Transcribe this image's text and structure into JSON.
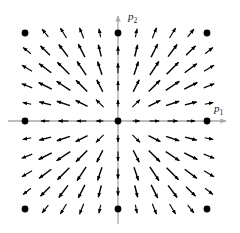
{
  "figure": {
    "title": "",
    "background_color": "#ffffff"
  },
  "axes": {
    "x_axis": {
      "label": "p",
      "label_subscript": "1",
      "color": "#a8a8a8",
      "y_pixel": 121,
      "x_start": 8,
      "x_end": 228,
      "arrowhead": "right"
    },
    "y_axis": {
      "label": "p",
      "label_subscript": "2",
      "color": "#a8a8a8",
      "x_pixel": 118,
      "y_start": 224,
      "y_end": 14,
      "arrowhead": "up"
    }
  },
  "markers": {
    "color": "#000000",
    "radius": 3.4,
    "points": [
      {
        "x": 118,
        "y": 121,
        "name": "origin-marker"
      },
      {
        "x": 25,
        "y": 33,
        "name": "corner-marker-top-left"
      },
      {
        "x": 207,
        "y": 33,
        "name": "corner-marker-top-right"
      },
      {
        "x": 25,
        "y": 209,
        "name": "corner-marker-bottom-left"
      },
      {
        "x": 207,
        "y": 209,
        "name": "corner-marker-bottom-right"
      },
      {
        "x": 25,
        "y": 121,
        "name": "edge-marker-left"
      },
      {
        "x": 207,
        "y": 121,
        "name": "edge-marker-right"
      },
      {
        "x": 118,
        "y": 33,
        "name": "edge-marker-top"
      },
      {
        "x": 118,
        "y": 209,
        "name": "edge-marker-bottom"
      }
    ]
  },
  "chart_data": {
    "type": "scatter",
    "plot_kind": "vector-field-quiver",
    "title": "",
    "xlabel": "p1",
    "ylabel": "p2",
    "xlim": [
      -5,
      5
    ],
    "ylim": [
      -5,
      5
    ],
    "grid": false,
    "legend": null,
    "arrow_color": "#000000",
    "grid_columns": 11,
    "grid_rows": 11,
    "x_ticks": [
      -5,
      -4,
      -3,
      -2,
      -1,
      0,
      1,
      2,
      3,
      4,
      5
    ],
    "y_ticks": [
      -5,
      -4,
      -3,
      -2,
      -1,
      0,
      1,
      2,
      3,
      4,
      5
    ],
    "vector_rule": {
      "u": "p1",
      "v": "p2",
      "note": "u proportional to x, v proportional to y; magnitude tapers at grid boundary"
    },
    "pixel_geometry": {
      "origin_x": 118,
      "origin_y": 121,
      "spacing_x": 18.2,
      "spacing_y": 17.6
    }
  }
}
